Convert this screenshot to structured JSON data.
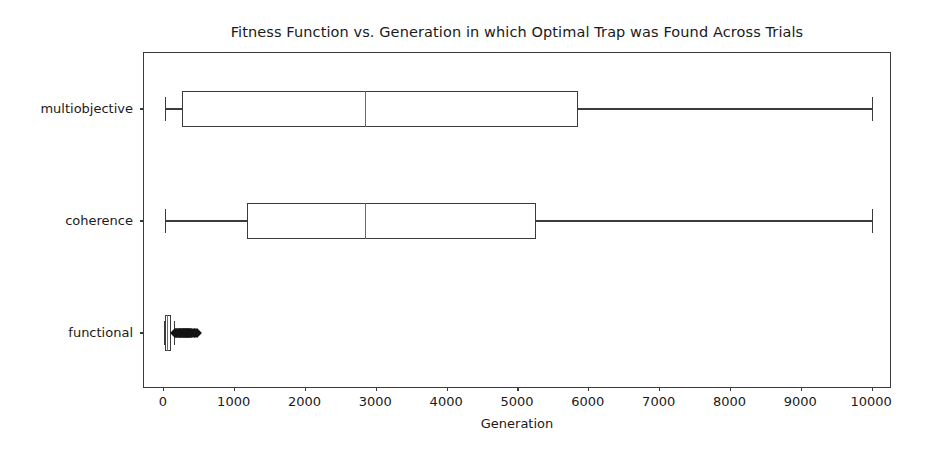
{
  "chart_data": {
    "type": "box",
    "title": "Fitness Function vs. Generation in which Optimal Trap was Found Across Trials",
    "xlabel": "Generation",
    "ylabel": "",
    "orientation": "horizontal",
    "grid": false,
    "legend": null,
    "xlim": [
      -280,
      10280
    ],
    "xticks": [
      0,
      1000,
      2000,
      3000,
      4000,
      5000,
      6000,
      7000,
      8000,
      9000,
      10000
    ],
    "xtick_labels": [
      "0",
      "1000",
      "2000",
      "3000",
      "4000",
      "5000",
      "6000",
      "7000",
      "8000",
      "9000",
      "10000"
    ],
    "categories": [
      "functional",
      "coherence",
      "multiobjective"
    ],
    "boxes": [
      {
        "label": "multiobjective",
        "whisker_low": 20,
        "q1": 260,
        "median": 2850,
        "q3": 5850,
        "whisker_high": 10000,
        "outliers": []
      },
      {
        "label": "coherence",
        "whisker_low": 20,
        "q1": 1180,
        "median": 2850,
        "q3": 5250,
        "whisker_high": 10000,
        "outliers": []
      },
      {
        "label": "functional",
        "whisker_low": 5,
        "q1": 12,
        "median": 55,
        "q3": 95,
        "whisker_high": 150,
        "outliers": [
          160,
          175,
          190,
          205,
          215,
          225,
          235,
          245,
          255,
          265,
          275,
          285,
          295,
          300,
          310,
          320,
          330,
          340,
          350,
          360,
          370,
          385,
          400,
          420,
          440,
          470
        ]
      }
    ]
  },
  "style": {
    "line_color": "#3b3b3b",
    "median_color": "#6b6b6b",
    "marker_color": "#141414",
    "background": "#ffffff",
    "text_color": "#1a1a1a"
  }
}
